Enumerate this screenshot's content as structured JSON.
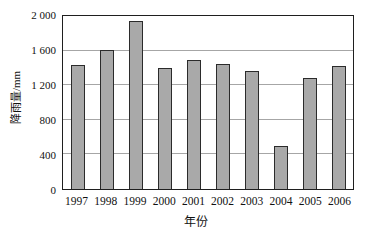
{
  "chart_data": {
    "type": "bar",
    "title": "",
    "categories": [
      "1997",
      "1998",
      "1999",
      "2000",
      "2001",
      "2002",
      "2003",
      "2004",
      "2005",
      "2006"
    ],
    "values": [
      1430,
      1610,
      1940,
      1400,
      1490,
      1450,
      1360,
      500,
      1280,
      1420
    ],
    "xlabel": "年份",
    "ylabel": "降雨量/mm",
    "ylim": [
      0,
      2000
    ],
    "ytick_interval": 400,
    "ytick_labels": [
      "0",
      "400",
      "800",
      "1 200",
      "1 600",
      "2 000"
    ],
    "grid": true,
    "legend": "none",
    "bar_color": "#a9a9a9",
    "bar_border_color": "#2b2b2b",
    "gridline_color": "#a6a6a6",
    "frame_color": "#1f1f1f",
    "background_color": "#ffffff"
  }
}
